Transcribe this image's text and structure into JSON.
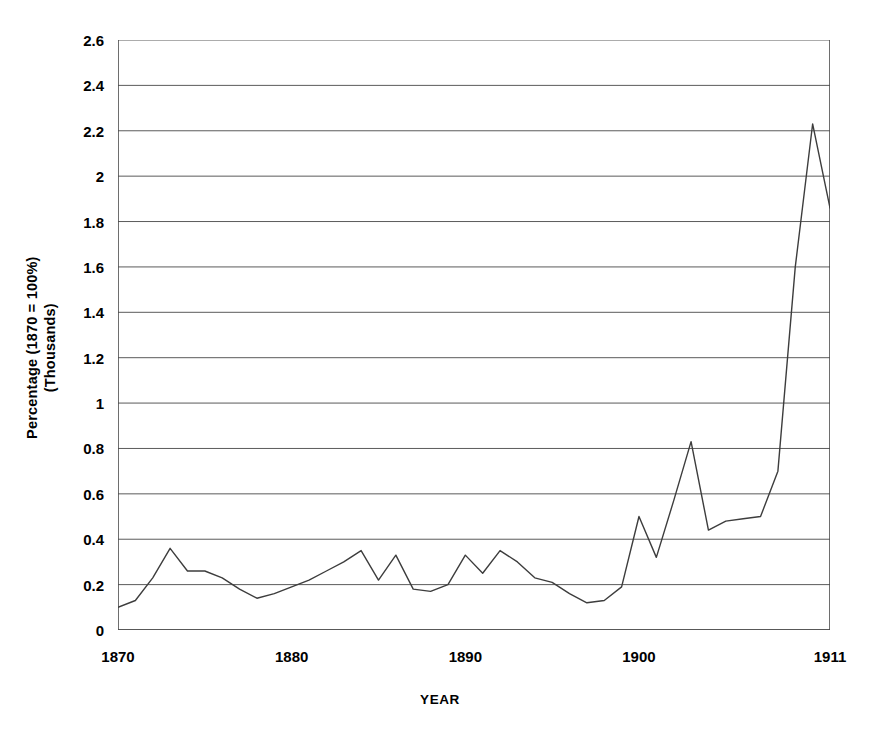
{
  "chart_data": {
    "type": "line",
    "title": "",
    "xlabel": "YEAR",
    "ylabel": "Percentage (1870 = 100%)",
    "ylabel_line2": "(Thousands)",
    "xlim": [
      1870,
      1911
    ],
    "ylim": [
      0,
      2.6
    ],
    "ytick_step": 0.2,
    "grid": "horizontal",
    "legend": "none",
    "line_color": "#3d3d3d",
    "axis_color": "#4a4a4a",
    "grid_color": "#5a5a5a",
    "background": "#ffffff",
    "x_tick_labels": [
      "1870",
      "1880",
      "1890",
      "1900",
      "1911"
    ],
    "x_tick_label_values": [
      1870,
      1880,
      1890,
      1900,
      1911
    ],
    "x_minor_ticks_every": 1,
    "y_tick_labels": [
      "2.6",
      "2.4",
      "2.2",
      "2",
      "1.8",
      "1.6",
      "1.4",
      "1.2",
      "1",
      "0.8",
      "0.6",
      "0.4",
      "0.2",
      "0"
    ],
    "y_tick_values": [
      2.6,
      2.4,
      2.2,
      2.0,
      1.8,
      1.6,
      1.4,
      1.2,
      1.0,
      0.8,
      0.6,
      0.4,
      0.2,
      0
    ],
    "x": [
      1870,
      1871,
      1872,
      1873,
      1874,
      1875,
      1876,
      1877,
      1878,
      1879,
      1880,
      1881,
      1882,
      1883,
      1884,
      1885,
      1886,
      1887,
      1888,
      1889,
      1890,
      1891,
      1892,
      1893,
      1894,
      1895,
      1896,
      1897,
      1898,
      1899,
      1900,
      1901,
      1902,
      1903,
      1904,
      1905,
      1906,
      1907,
      1908,
      1909,
      1910,
      1911
    ],
    "values": [
      0.1,
      0.13,
      0.23,
      0.36,
      0.26,
      0.26,
      0.23,
      0.18,
      0.14,
      0.16,
      0.19,
      0.22,
      0.26,
      0.3,
      0.35,
      0.22,
      0.33,
      0.18,
      0.17,
      0.2,
      0.33,
      0.25,
      0.35,
      0.3,
      0.23,
      0.21,
      0.16,
      0.12,
      0.13,
      0.19,
      0.5,
      0.32,
      0.57,
      0.83,
      0.44,
      0.48,
      0.49,
      0.5,
      0.7,
      1.6,
      2.23,
      1.86
    ],
    "series_name": "Percentage (1870 = 100%)",
    "annotations": []
  }
}
